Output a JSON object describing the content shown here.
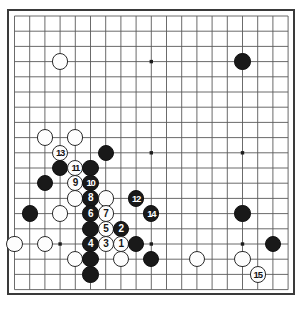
{
  "diagram": {
    "kind": "go-board-diagram",
    "board_size": 19,
    "title": "",
    "caption": "",
    "colors": {
      "board_background": "#ffffff",
      "grid_line": "#5a5a5a",
      "border": "#3a3a3a",
      "black_stone": "#191919",
      "white_stone": "#fdfdfd",
      "black_label": "#ffffff",
      "white_label": "#151515"
    },
    "star_points": [
      {
        "col": 3,
        "row": 3
      },
      {
        "col": 9,
        "row": 3
      },
      {
        "col": 15,
        "row": 3
      },
      {
        "col": 3,
        "row": 9
      },
      {
        "col": 9,
        "row": 9
      },
      {
        "col": 15,
        "row": 9
      },
      {
        "col": 3,
        "row": 15
      },
      {
        "col": 9,
        "row": 15
      },
      {
        "col": 15,
        "row": 15
      }
    ],
    "stones": [
      {
        "col": 3,
        "row": 3,
        "color": "white",
        "label": ""
      },
      {
        "col": 15,
        "row": 3,
        "color": "black",
        "label": ""
      },
      {
        "col": 2,
        "row": 8,
        "color": "white",
        "label": ""
      },
      {
        "col": 4,
        "row": 8,
        "color": "white",
        "label": ""
      },
      {
        "col": 6,
        "row": 9,
        "color": "black",
        "label": ""
      },
      {
        "col": 3,
        "row": 9,
        "color": "white",
        "label": "13"
      },
      {
        "col": 3,
        "row": 10,
        "color": "black",
        "label": ""
      },
      {
        "col": 4,
        "row": 10,
        "color": "white",
        "label": "11"
      },
      {
        "col": 5,
        "row": 10,
        "color": "black",
        "label": ""
      },
      {
        "col": 2,
        "row": 11,
        "color": "black",
        "label": ""
      },
      {
        "col": 4,
        "row": 11,
        "color": "white",
        "label": "9"
      },
      {
        "col": 5,
        "row": 11,
        "color": "black",
        "label": "10"
      },
      {
        "col": 4,
        "row": 12,
        "color": "white",
        "label": ""
      },
      {
        "col": 5,
        "row": 12,
        "color": "black",
        "label": "8"
      },
      {
        "col": 6,
        "row": 12,
        "color": "white",
        "label": ""
      },
      {
        "col": 8,
        "row": 12,
        "color": "black",
        "label": "12"
      },
      {
        "col": 1,
        "row": 13,
        "color": "black",
        "label": ""
      },
      {
        "col": 3,
        "row": 13,
        "color": "white",
        "label": ""
      },
      {
        "col": 5,
        "row": 13,
        "color": "black",
        "label": "6"
      },
      {
        "col": 6,
        "row": 13,
        "color": "white",
        "label": "7"
      },
      {
        "col": 9,
        "row": 13,
        "color": "black",
        "label": "14"
      },
      {
        "col": 15,
        "row": 13,
        "color": "black",
        "label": ""
      },
      {
        "col": 5,
        "row": 14,
        "color": "black",
        "label": ""
      },
      {
        "col": 6,
        "row": 14,
        "color": "white",
        "label": "5"
      },
      {
        "col": 7,
        "row": 14,
        "color": "black",
        "label": "2"
      },
      {
        "col": 0,
        "row": 15,
        "color": "white",
        "label": ""
      },
      {
        "col": 2,
        "row": 15,
        "color": "white",
        "label": ""
      },
      {
        "col": 5,
        "row": 15,
        "color": "black",
        "label": "4"
      },
      {
        "col": 6,
        "row": 15,
        "color": "white",
        "label": "3"
      },
      {
        "col": 7,
        "row": 15,
        "color": "white",
        "label": "1"
      },
      {
        "col": 8,
        "row": 15,
        "color": "black",
        "label": ""
      },
      {
        "col": 17,
        "row": 15,
        "color": "black",
        "label": ""
      },
      {
        "col": 4,
        "row": 16,
        "color": "white",
        "label": ""
      },
      {
        "col": 5,
        "row": 16,
        "color": "black",
        "label": ""
      },
      {
        "col": 7,
        "row": 16,
        "color": "white",
        "label": ""
      },
      {
        "col": 9,
        "row": 16,
        "color": "black",
        "label": ""
      },
      {
        "col": 12,
        "row": 16,
        "color": "white",
        "label": ""
      },
      {
        "col": 15,
        "row": 16,
        "color": "white",
        "label": ""
      },
      {
        "col": 5,
        "row": 17,
        "color": "black",
        "label": ""
      },
      {
        "col": 16,
        "row": 17,
        "color": "white",
        "label": "15"
      }
    ],
    "move_numbers": [
      {
        "number": "1",
        "color": "white"
      },
      {
        "number": "2",
        "color": "black"
      },
      {
        "number": "3",
        "color": "white"
      },
      {
        "number": "4",
        "color": "black"
      },
      {
        "number": "5",
        "color": "white"
      },
      {
        "number": "6",
        "color": "black"
      },
      {
        "number": "7",
        "color": "white"
      },
      {
        "number": "8",
        "color": "black"
      },
      {
        "number": "9",
        "color": "white"
      },
      {
        "number": "10",
        "color": "black"
      },
      {
        "number": "11",
        "color": "white"
      },
      {
        "number": "12",
        "color": "black"
      },
      {
        "number": "13",
        "color": "white"
      },
      {
        "number": "14",
        "color": "black"
      },
      {
        "number": "15",
        "color": "white"
      }
    ],
    "geometry": {
      "origin_x": 14.5,
      "origin_y": 16.0,
      "spacing": 15.2,
      "stone_diameter": 16.4,
      "star_point_size": 3.4
    }
  }
}
